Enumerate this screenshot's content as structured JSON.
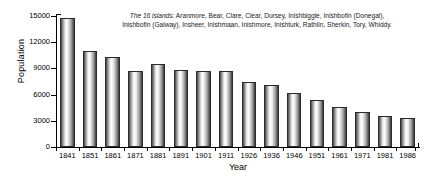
{
  "chart_data": {
    "type": "bar",
    "title": "",
    "xlabel": "Year",
    "ylabel": "Population",
    "categories": [
      "1841",
      "1851",
      "1861",
      "1871",
      "1881",
      "1891",
      "1901",
      "1911",
      "1926",
      "1936",
      "1946",
      "1951",
      "1961",
      "1971",
      "1981",
      "1986"
    ],
    "values": [
      14800,
      11050,
      10300,
      8650,
      9550,
      8850,
      8700,
      8650,
      7450,
      7050,
      6150,
      5400,
      4600,
      4050,
      3600,
      3300
    ],
    "ylim": [
      0,
      15000
    ],
    "yticks": [
      0,
      3000,
      6000,
      9000,
      12000,
      15000
    ],
    "ytick_labels": [
      "0",
      "3000",
      "6000",
      "9000",
      "12000",
      "15000"
    ],
    "grid": false,
    "legend": "none"
  },
  "annotation": {
    "lead": "The 16 islands:",
    "line1_rest": " Aranmore, Bear, Clare, Clear, Dursey, Inishbiggle, Inishbofin (Donegal),",
    "line2": "Inishbofin (Galway), Insheer, Inishmaan, Inishmore, Inishturk, Rathlin, Sherkin, Tory, Whiddy."
  }
}
